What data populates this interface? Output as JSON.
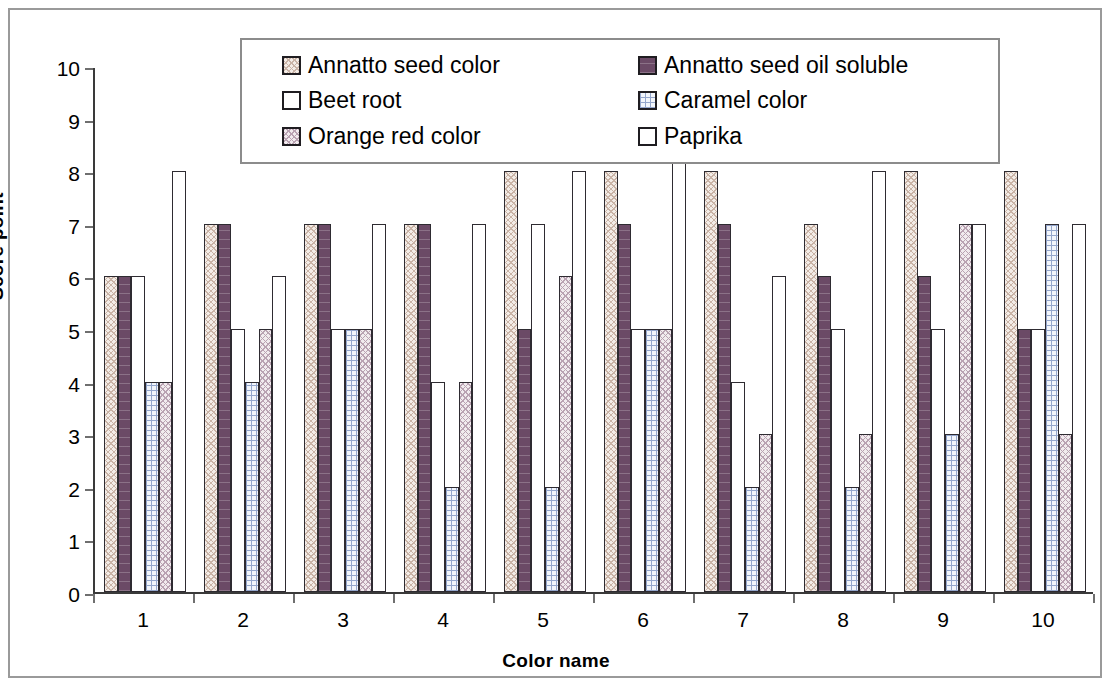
{
  "chart_data": {
    "type": "bar",
    "title": "",
    "xlabel": "Color name",
    "ylabel": "Score point",
    "categories": [
      "1",
      "2",
      "3",
      "4",
      "5",
      "6",
      "7",
      "8",
      "9",
      "10"
    ],
    "ylim": [
      0,
      10
    ],
    "y_ticks": [
      "0",
      "1",
      "2",
      "3",
      "4",
      "5",
      "6",
      "7",
      "8",
      "9",
      "10"
    ],
    "grid": false,
    "legend_position": "top-center",
    "series": [
      {
        "name": "Annatto seed color",
        "swatch_class": "fill-annatto-seed-color",
        "values": [
          6,
          7,
          7,
          7,
          8,
          8,
          8,
          7,
          8,
          8
        ]
      },
      {
        "name": "Annatto seed oil soluble",
        "swatch_class": "fill-annatto-seed-oil-soluble",
        "values": [
          6,
          7,
          7,
          7,
          5,
          7,
          7,
          6,
          6,
          5
        ]
      },
      {
        "name": "Beet root",
        "swatch_class": "fill-beet-root",
        "values": [
          6,
          5,
          5,
          4,
          7,
          5,
          4,
          5,
          5,
          5
        ]
      },
      {
        "name": "Caramel color",
        "swatch_class": "fill-caramel-color",
        "values": [
          4,
          4,
          5,
          2,
          2,
          5,
          2,
          2,
          3,
          7
        ]
      },
      {
        "name": "Orange red color",
        "swatch_class": "fill-orange-red-color",
        "values": [
          4,
          5,
          5,
          4,
          6,
          5,
          3,
          3,
          7,
          3
        ]
      },
      {
        "name": "Paprika",
        "swatch_class": "fill-paprika",
        "values": [
          8,
          6,
          7,
          7,
          8,
          9,
          6,
          8,
          7,
          7
        ]
      }
    ]
  },
  "axes": {
    "y_title": "Score point",
    "x_title": "Color name"
  }
}
